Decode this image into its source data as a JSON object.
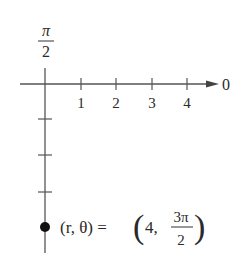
{
  "diagram": {
    "type": "polar-coordinate-plot",
    "axis_labels": {
      "vertical_top": {
        "numerator": "π",
        "denominator": "2"
      },
      "horizontal_right": "0"
    },
    "polar_axis_ticks": [
      "1",
      "2",
      "3",
      "4"
    ],
    "point": {
      "r": 4,
      "theta": "3π/2",
      "label_lhs": "(r, θ) =",
      "label_r": "4,",
      "label_theta_num": "3π",
      "label_theta_den": "2"
    },
    "colors": {
      "ink": "#2a2a2a",
      "axis": "#555555"
    }
  }
}
